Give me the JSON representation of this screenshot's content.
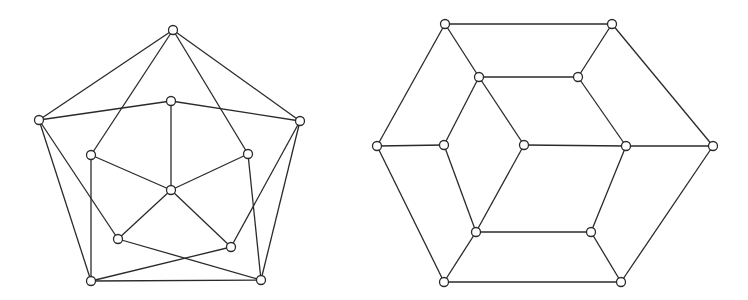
{
  "figure": {
    "width": 748,
    "height": 300,
    "stroke_color": "#2a2a2a",
    "vertex_fill": "#ffffff",
    "vertex_radius": 4.5
  },
  "graphs": [
    {
      "name": "left-graph-pentagon",
      "vertices": [
        {
          "id": "T",
          "x": 173,
          "y": 30
        },
        {
          "id": "L",
          "x": 39,
          "y": 120
        },
        {
          "id": "R",
          "x": 300,
          "y": 121
        },
        {
          "id": "BL",
          "x": 91,
          "y": 281
        },
        {
          "id": "BR",
          "x": 261,
          "y": 280
        },
        {
          "id": "IT",
          "x": 171,
          "y": 101
        },
        {
          "id": "IL",
          "x": 91,
          "y": 155
        },
        {
          "id": "IR",
          "x": 248,
          "y": 154
        },
        {
          "id": "C",
          "x": 171,
          "y": 190
        },
        {
          "id": "IBL",
          "x": 118,
          "y": 239
        },
        {
          "id": "IBR",
          "x": 231,
          "y": 247
        }
      ],
      "edges": [
        [
          "T",
          "L"
        ],
        [
          "T",
          "R"
        ],
        [
          "T",
          "IL"
        ],
        [
          "T",
          "IR"
        ],
        [
          "L",
          "IT"
        ],
        [
          "R",
          "IT"
        ],
        [
          "IT",
          "C"
        ],
        [
          "IL",
          "C"
        ],
        [
          "IR",
          "C"
        ],
        [
          "C",
          "IBL"
        ],
        [
          "C",
          "IBR"
        ],
        [
          "L",
          "BL"
        ],
        [
          "L",
          "IBL"
        ],
        [
          "IL",
          "BL"
        ],
        [
          "R",
          "BR"
        ],
        [
          "R",
          "IBR"
        ],
        [
          "IR",
          "BR"
        ],
        [
          "BL",
          "BR"
        ],
        [
          "BL",
          "IBR"
        ],
        [
          "IBL",
          "BR"
        ]
      ]
    },
    {
      "name": "right-graph-hexagon",
      "vertices": [
        {
          "id": "TL",
          "x": 445,
          "y": 24
        },
        {
          "id": "TR",
          "x": 612,
          "y": 24
        },
        {
          "id": "L",
          "x": 377,
          "y": 146
        },
        {
          "id": "R",
          "x": 713,
          "y": 146
        },
        {
          "id": "BL",
          "x": 444,
          "y": 282
        },
        {
          "id": "BR",
          "x": 621,
          "y": 282
        },
        {
          "id": "ITL",
          "x": 479,
          "y": 77
        },
        {
          "id": "ITR",
          "x": 578,
          "y": 77
        },
        {
          "id": "IL",
          "x": 444,
          "y": 145
        },
        {
          "id": "C",
          "x": 524,
          "y": 145
        },
        {
          "id": "IR",
          "x": 626,
          "y": 146
        },
        {
          "id": "IBL",
          "x": 476,
          "y": 232
        },
        {
          "id": "IBR",
          "x": 591,
          "y": 232
        }
      ],
      "edges": [
        [
          "TL",
          "TR"
        ],
        [
          "TL",
          "L"
        ],
        [
          "TL",
          "ITL"
        ],
        [
          "ITL",
          "ITR"
        ],
        [
          "ITL",
          "IL"
        ],
        [
          "ITL",
          "C"
        ],
        [
          "L",
          "IL"
        ],
        [
          "L",
          "BL"
        ],
        [
          "TR",
          "ITR"
        ],
        [
          "TR",
          "R"
        ],
        [
          "ITR",
          "IR"
        ],
        [
          "C",
          "IR"
        ],
        [
          "C",
          "IBL"
        ],
        [
          "IR",
          "R"
        ],
        [
          "IR",
          "IBR"
        ],
        [
          "IL",
          "IBL"
        ],
        [
          "IBL",
          "IBR"
        ],
        [
          "IBL",
          "BL"
        ],
        [
          "IBR",
          "BR"
        ],
        [
          "BL",
          "BR"
        ],
        [
          "BR",
          "R"
        ]
      ]
    }
  ]
}
